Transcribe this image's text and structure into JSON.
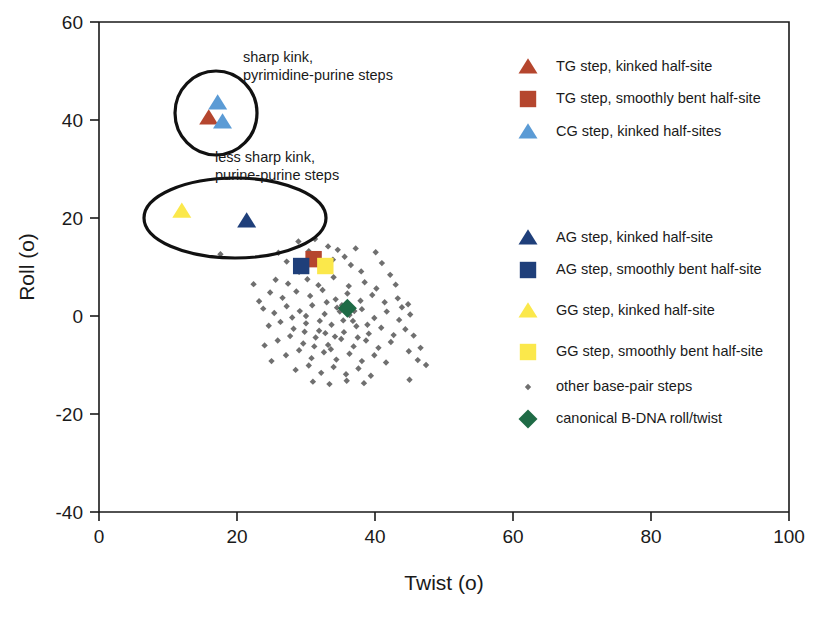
{
  "chart_data": {
    "type": "scatter",
    "title": "",
    "xlabel": "Twist (o)",
    "ylabel": "Roll (o)",
    "xlim": [
      0,
      100
    ],
    "ylim": [
      -40,
      60
    ],
    "xticks": [
      0,
      20,
      40,
      60,
      80,
      100
    ],
    "yticks": [
      -40,
      -20,
      0,
      20,
      40,
      60
    ],
    "grid": false,
    "legend_position": "right",
    "colors": {
      "tg_red": "#b5462e",
      "cg_light_blue": "#5b9bd5",
      "ag_dark_blue": "#1f3f7a",
      "gg_yellow": "#fbe84b",
      "other_gray": "#6f6f6f",
      "bdna_green": "#1f6b46",
      "outline": "#111111",
      "axis": "#1a1a1a"
    },
    "series": [
      {
        "name": "TG step, kinked half-site",
        "marker": "triangle",
        "color": "#b5462e",
        "points": [
          [
            15.9,
            40.4
          ]
        ]
      },
      {
        "name": "TG step, smoothly bent half-site",
        "marker": "square",
        "color": "#b5462e",
        "points": [
          [
            31.1,
            11.6
          ]
        ]
      },
      {
        "name": "CG step, kinked half-sites",
        "marker": "triangle",
        "color": "#5b9bd5",
        "points": [
          [
            17.2,
            43.5
          ],
          [
            17.9,
            39.6
          ]
        ]
      },
      {
        "name": "AG step, kinked half-site",
        "marker": "triangle",
        "color": "#1f3f7a",
        "points": [
          [
            21.4,
            19.4
          ]
        ]
      },
      {
        "name": "AG step, smoothly bent half-site",
        "marker": "square",
        "color": "#1f3f7a",
        "points": [
          [
            29.3,
            10.2
          ]
        ]
      },
      {
        "name": "GG step, kinked half-site",
        "marker": "triangle",
        "color": "#fbe84b",
        "points": [
          [
            12.0,
            21.4
          ]
        ]
      },
      {
        "name": "GG step, smoothly bent half-site",
        "marker": "square",
        "color": "#fbe84b",
        "points": [
          [
            32.8,
            10.2
          ]
        ]
      },
      {
        "name": "canonical B-DNA roll/twist",
        "marker": "diamond",
        "color": "#1f6b46",
        "points": [
          [
            36.0,
            1.6
          ]
        ]
      },
      {
        "name": "other base-pair steps",
        "marker": "small-diamond",
        "color": "#6f6f6f",
        "points": [
          [
            28.9,
            15.2
          ],
          [
            31.3,
            15.7
          ],
          [
            33.2,
            14.2
          ],
          [
            34.6,
            13.5
          ],
          [
            26.0,
            12.9
          ],
          [
            30.4,
            13.2
          ],
          [
            35.6,
            12.1
          ],
          [
            37.2,
            13.8
          ],
          [
            40.1,
            13.0
          ],
          [
            27.2,
            11.1
          ],
          [
            29.0,
            9.0
          ],
          [
            33.9,
            11.5
          ],
          [
            36.5,
            10.4
          ],
          [
            38.0,
            9.1
          ],
          [
            41.0,
            10.8
          ],
          [
            42.2,
            8.4
          ],
          [
            25.6,
            7.4
          ],
          [
            27.4,
            6.6
          ],
          [
            30.2,
            7.5
          ],
          [
            31.8,
            6.3
          ],
          [
            34.0,
            7.9
          ],
          [
            36.2,
            6.1
          ],
          [
            38.5,
            6.9
          ],
          [
            40.2,
            5.6
          ],
          [
            43.0,
            6.4
          ],
          [
            24.8,
            4.8
          ],
          [
            26.6,
            3.7
          ],
          [
            28.6,
            5.0
          ],
          [
            30.6,
            4.1
          ],
          [
            32.4,
            5.3
          ],
          [
            34.3,
            3.4
          ],
          [
            36.0,
            4.6
          ],
          [
            37.9,
            3.1
          ],
          [
            39.6,
            4.3
          ],
          [
            41.4,
            2.8
          ],
          [
            43.3,
            3.6
          ],
          [
            44.8,
            2.4
          ],
          [
            23.8,
            1.5
          ],
          [
            25.4,
            0.6
          ],
          [
            27.2,
            2.0
          ],
          [
            29.1,
            1.0
          ],
          [
            30.9,
            2.2
          ],
          [
            32.7,
            0.4
          ],
          [
            34.5,
            1.7
          ],
          [
            36.3,
            0.2
          ],
          [
            38.1,
            1.4
          ],
          [
            39.9,
            -0.4
          ],
          [
            41.7,
            0.9
          ],
          [
            43.5,
            -0.8
          ],
          [
            45.1,
            0.3
          ],
          [
            24.6,
            -2.0
          ],
          [
            26.3,
            -1.2
          ],
          [
            28.2,
            -2.6
          ],
          [
            30.0,
            -1.5
          ],
          [
            31.9,
            -3.0
          ],
          [
            33.7,
            -1.8
          ],
          [
            35.5,
            -3.3
          ],
          [
            37.3,
            -2.1
          ],
          [
            39.1,
            -3.6
          ],
          [
            40.9,
            -2.4
          ],
          [
            42.7,
            -3.9
          ],
          [
            44.4,
            -2.7
          ],
          [
            25.9,
            -5.0
          ],
          [
            27.7,
            -4.1
          ],
          [
            29.6,
            -5.6
          ],
          [
            31.4,
            -4.4
          ],
          [
            33.2,
            -5.9
          ],
          [
            35.1,
            -4.7
          ],
          [
            36.9,
            -6.2
          ],
          [
            38.7,
            -5.0
          ],
          [
            40.5,
            -6.5
          ],
          [
            42.3,
            -5.3
          ],
          [
            27.1,
            -8.0
          ],
          [
            29.0,
            -7.0
          ],
          [
            30.8,
            -8.6
          ],
          [
            32.6,
            -7.4
          ],
          [
            34.4,
            -8.9
          ],
          [
            36.3,
            -7.7
          ],
          [
            38.1,
            -9.2
          ],
          [
            39.9,
            -8.0
          ],
          [
            41.6,
            -9.5
          ],
          [
            28.5,
            -11.0
          ],
          [
            30.4,
            -10.1
          ],
          [
            32.2,
            -11.6
          ],
          [
            34.0,
            -10.4
          ],
          [
            35.8,
            -11.9
          ],
          [
            37.6,
            -10.7
          ],
          [
            39.4,
            -12.2
          ],
          [
            31.0,
            -13.4
          ],
          [
            33.4,
            -13.9
          ],
          [
            35.9,
            -13.2
          ],
          [
            38.4,
            -13.7
          ],
          [
            17.6,
            12.6
          ],
          [
            22.4,
            6.5
          ],
          [
            23.2,
            3.0
          ],
          [
            24.0,
            -6.0
          ],
          [
            25.0,
            -9.2
          ],
          [
            45.6,
            -4.0
          ],
          [
            46.6,
            -6.5
          ],
          [
            46.2,
            -9.0
          ],
          [
            47.4,
            -10.0
          ],
          [
            45.0,
            -13.0
          ],
          [
            43.9,
            1.8
          ],
          [
            44.9,
            -7.2
          ],
          [
            30.0,
            0.0
          ],
          [
            34.9,
            0.9
          ],
          [
            33.0,
            2.8
          ],
          [
            35.2,
            2.2
          ],
          [
            37.0,
            1.0
          ],
          [
            32.0,
            -1.0
          ],
          [
            36.8,
            -1.0
          ],
          [
            34.2,
            -4.2
          ],
          [
            32.8,
            -3.5
          ],
          [
            31.2,
            -6.2
          ],
          [
            33.6,
            -6.8
          ],
          [
            35.4,
            -0.9
          ],
          [
            37.5,
            -4.4
          ],
          [
            38.9,
            -1.8
          ],
          [
            29.8,
            -3.2
          ],
          [
            28.0,
            -0.3
          ]
        ]
      }
    ],
    "annotations": [
      {
        "name": "sharp-kink-label",
        "lines": [
          "sharp kink,",
          "pyrimidine-purine steps"
        ],
        "x_px": 243,
        "y_px": 62
      },
      {
        "name": "less-sharp-kink-label",
        "lines": [
          "less sharp kink,",
          "purine-purine steps"
        ],
        "x_px": 215,
        "y_px": 162
      }
    ],
    "highlight_shapes": [
      {
        "name": "sharp-kink-circle",
        "shape": "ellipse",
        "cx_px": 216,
        "cy_px": 113,
        "rx_px": 41,
        "ry_px": 42
      },
      {
        "name": "less-sharp-kink-ellipse",
        "shape": "ellipse",
        "cx_px": 235,
        "cy_px": 218,
        "rx_px": 91,
        "ry_px": 40
      }
    ]
  },
  "legend": {
    "title": "",
    "entries": [
      {
        "label": "TG step, kinked half-site",
        "marker": "triangle",
        "color": "#b5462e",
        "name": "legend-tg-kinked"
      },
      {
        "label": "TG step, smoothly bent half-site",
        "marker": "square",
        "color": "#b5462e",
        "name": "legend-tg-smooth"
      },
      {
        "label": "CG step, kinked half-sites",
        "marker": "triangle",
        "color": "#5b9bd5",
        "name": "legend-cg-kinked"
      },
      {
        "label": "AG step, kinked half-site",
        "marker": "triangle",
        "color": "#1f3f7a",
        "name": "legend-ag-kinked"
      },
      {
        "label": "AG step, smoothly bent half-site",
        "marker": "square",
        "color": "#1f3f7a",
        "name": "legend-ag-smooth"
      },
      {
        "label": "GG step, kinked half-site",
        "marker": "triangle",
        "color": "#fbe84b",
        "name": "legend-gg-kinked"
      },
      {
        "label": "GG step, smoothly bent half-site",
        "marker": "square",
        "color": "#fbe84b",
        "name": "legend-gg-smooth"
      },
      {
        "label": "other base-pair steps",
        "marker": "small-diamond",
        "color": "#6f6f6f",
        "name": "legend-other-steps"
      },
      {
        "label": "canonical B-DNA roll/twist",
        "marker": "diamond",
        "color": "#1f6b46",
        "name": "legend-bdna"
      }
    ]
  }
}
